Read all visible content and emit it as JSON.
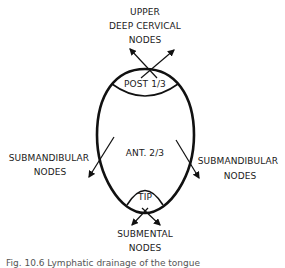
{
  "diagram": {
    "regions": {
      "posterior": "POST 1/3",
      "anterior": "ANT. 2/3",
      "tip": "TIP"
    },
    "drainage": {
      "upper_line1": "UPPER",
      "upper_line2": "DEEP CERVICAL",
      "upper_line3": "NODES",
      "left_line1": "SUBMANDIBULAR",
      "left_line2": "NODES",
      "right_line1": "SUBMANDIBULAR",
      "right_line2": "NODES",
      "bottom_line1": "SUBMENTAL",
      "bottom_line2": "NODES"
    },
    "colors": {
      "stroke": "#111111",
      "background": "#ffffff"
    }
  },
  "caption": "Fig. 10.6 Lymphatic drainage of the tongue"
}
